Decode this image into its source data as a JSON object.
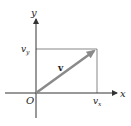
{
  "diagram": {
    "axes": {
      "x_label": "x",
      "y_label": "y",
      "origin_label": "O"
    },
    "vector": {
      "label": "v",
      "color": "#8a8a8a"
    },
    "components": {
      "x_component_label": "v",
      "x_component_sub": "x",
      "y_component_label": "v",
      "y_component_sub": "y"
    },
    "colors": {
      "axis": "#333333",
      "guide": "#555555"
    }
  }
}
